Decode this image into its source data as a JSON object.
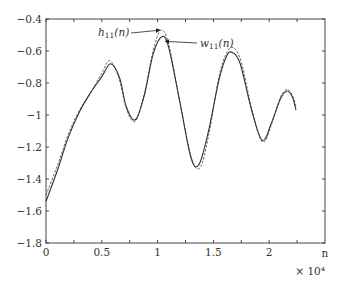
{
  "chart_data": {
    "type": "line",
    "title": "",
    "xlabel": "n",
    "x_multiplier": "× 10⁴",
    "ylabel": "",
    "xlim": [
      0,
      2.5
    ],
    "ylim": [
      -1.8,
      -0.4
    ],
    "grid": false,
    "x_ticks": [
      0,
      0.5,
      1,
      1.5,
      2
    ],
    "x_tick_labels": [
      "0",
      "0.5",
      "1",
      "1.5",
      "2"
    ],
    "x_minor_ticks": [
      0.25,
      0.75,
      1.25,
      1.75,
      2.25
    ],
    "y_ticks": [
      -0.4,
      -0.6,
      -0.8,
      -1,
      -1.2,
      -1.4,
      -1.6,
      -1.8
    ],
    "y_tick_labels": [
      "-0.4",
      "-0.6",
      "-0.8",
      "-1",
      "-1.2",
      "-1.4",
      "-1.6",
      "-1.8"
    ],
    "series": [
      {
        "name": "h11(n)",
        "style": "dashed",
        "color": "#555555",
        "x": [
          0,
          0.1,
          0.2,
          0.3,
          0.4,
          0.5,
          0.57,
          0.65,
          0.72,
          0.8,
          0.88,
          0.96,
          1.03,
          1.1,
          1.2,
          1.3,
          1.38,
          1.46,
          1.55,
          1.62,
          1.68,
          1.75,
          1.85,
          1.94,
          2.02,
          2.1,
          2.16,
          2.21,
          2.24
        ],
        "y": [
          -1.5,
          -1.32,
          -1.12,
          -0.97,
          -0.86,
          -0.74,
          -0.66,
          -0.76,
          -0.96,
          -1.04,
          -0.87,
          -0.6,
          -0.47,
          -0.56,
          -0.92,
          -1.26,
          -1.33,
          -1.12,
          -0.76,
          -0.61,
          -0.58,
          -0.67,
          -0.98,
          -1.17,
          -1.06,
          -0.89,
          -0.84,
          -0.88,
          -0.95
        ]
      },
      {
        "name": "w11(n)",
        "style": "solid",
        "color": "#333333",
        "x": [
          0,
          0.1,
          0.2,
          0.3,
          0.4,
          0.5,
          0.58,
          0.66,
          0.72,
          0.8,
          0.88,
          0.96,
          1.04,
          1.1,
          1.2,
          1.3,
          1.37,
          1.45,
          1.55,
          1.62,
          1.67,
          1.74,
          1.85,
          1.94,
          2.02,
          2.1,
          2.16,
          2.21,
          2.24
        ],
        "y": [
          -1.54,
          -1.35,
          -1.14,
          -0.98,
          -0.86,
          -0.76,
          -0.68,
          -0.77,
          -0.95,
          -1.03,
          -0.88,
          -0.62,
          -0.51,
          -0.58,
          -0.92,
          -1.27,
          -1.31,
          -1.12,
          -0.78,
          -0.63,
          -0.61,
          -0.68,
          -0.99,
          -1.16,
          -1.05,
          -0.9,
          -0.85,
          -0.89,
          -0.97
        ]
      }
    ],
    "annotations": [
      {
        "text": "h",
        "sub": "11",
        "suffix": "(n)",
        "target_series": "h11(n)",
        "target_x": 1.02,
        "target_y": -0.47
      },
      {
        "text": "w",
        "sub": "11",
        "suffix": "(n)",
        "target_series": "w11(n)",
        "target_x": 1.07,
        "target_y": -0.54
      }
    ]
  }
}
